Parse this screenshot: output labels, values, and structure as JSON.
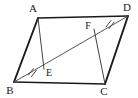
{
  "figure": {
    "kind": "geometry-diagram",
    "background_color": "#ffffff",
    "stroke_color": "#1a1a1a",
    "light_stroke_color": "#555555",
    "vertices": [
      {
        "id": "A",
        "label": "A",
        "x": 38,
        "y": 18,
        "label_x": 33,
        "label_y": 12
      },
      {
        "id": "D",
        "label": "D",
        "x": 128,
        "y": 16,
        "label_x": 125,
        "label_y": 11
      },
      {
        "id": "B",
        "label": "B",
        "x": 14,
        "y": 82,
        "label_x": 9,
        "label_y": 94
      },
      {
        "id": "C",
        "label": "C",
        "x": 105,
        "y": 84,
        "label_x": 102,
        "label_y": 95
      }
    ],
    "interior_points": [
      {
        "id": "E",
        "label": "E",
        "x": 44,
        "y": 69,
        "label_x": 47,
        "label_y": 75
      },
      {
        "id": "F",
        "label": "F",
        "x": 94,
        "y": 29,
        "label_x": 87,
        "label_y": 28
      }
    ],
    "edges": [
      {
        "id": "AB",
        "from": "A",
        "to": "B",
        "style": "side-edge"
      },
      {
        "id": "DC",
        "from": "D",
        "to": "C",
        "style": "side-edge"
      },
      {
        "id": "AD",
        "from": "A",
        "to": "D",
        "style": "top-edge"
      },
      {
        "id": "BC",
        "from": "B",
        "to": "C",
        "style": "bottom-edge"
      }
    ],
    "diagonal": {
      "id": "BD",
      "from": "B",
      "to": "D",
      "style": "diagonal-line"
    },
    "cevians": [
      {
        "id": "AE",
        "from": "A",
        "to": "E",
        "style": "cevian-line"
      },
      {
        "id": "CF",
        "from": "C",
        "to": "F",
        "style": "cevian-line"
      }
    ],
    "tick_marks": [
      {
        "id": "tick-BE",
        "on_segment": "BE",
        "count": 2,
        "x": 31,
        "y": 71
      },
      {
        "id": "tick-FD",
        "on_segment": "FD",
        "count": 2,
        "x": 108,
        "y": 23
      }
    ]
  }
}
